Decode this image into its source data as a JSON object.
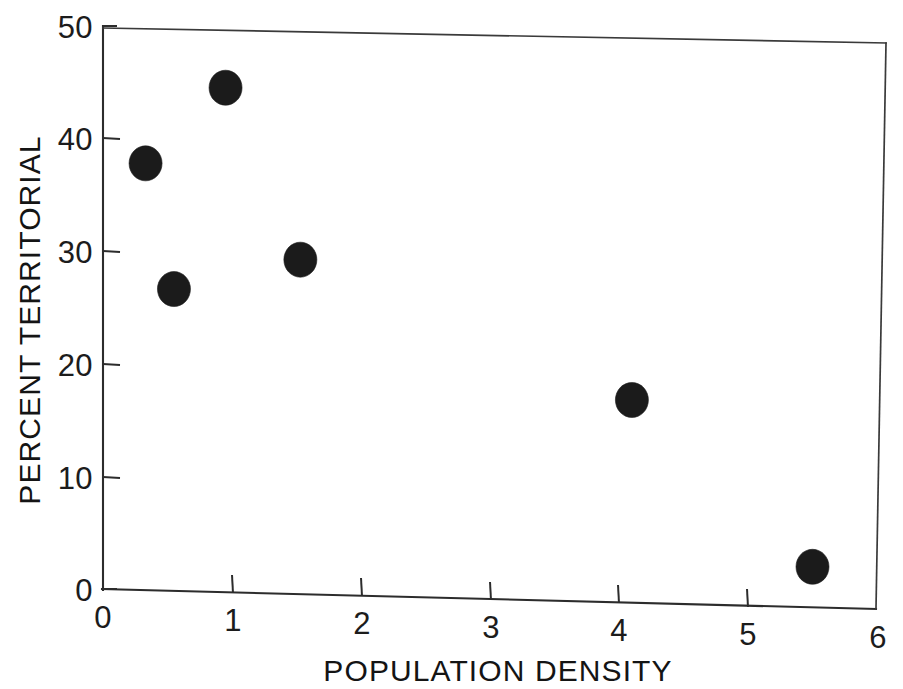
{
  "chart_data": {
    "type": "scatter",
    "title": "",
    "xlabel": "POPULATION DENSITY",
    "ylabel": "PERCENT TERRITORIAL",
    "xlim": [
      0,
      6
    ],
    "ylim": [
      0,
      50
    ],
    "xticks": [
      0,
      1,
      2,
      3,
      4,
      5,
      6
    ],
    "yticks": [
      0,
      10,
      20,
      30,
      40,
      50
    ],
    "xtick_labels": [
      "0",
      "1",
      "2",
      "3",
      "4",
      "5",
      "6"
    ],
    "ytick_labels": [
      "0",
      "10",
      "20",
      "30",
      "40",
      "50"
    ],
    "grid": false,
    "legend": false,
    "legend_position": "none",
    "marker": "filled-circle",
    "marker_color": "#1b1b1b",
    "series": [
      {
        "name": "territoriality vs density",
        "points": [
          {
            "x": 0.33,
            "y": 37.9
          },
          {
            "x": 0.55,
            "y": 26.8
          },
          {
            "x": 0.95,
            "y": 44.8
          },
          {
            "x": 1.53,
            "y": 29.7
          },
          {
            "x": 4.1,
            "y": 18.0
          },
          {
            "x": 5.5,
            "y": 3.6
          }
        ]
      }
    ],
    "x": [
      0.33,
      0.55,
      0.95,
      1.53,
      4.1,
      5.5
    ],
    "y": [
      37.9,
      26.8,
      44.8,
      29.7,
      18.0,
      3.6
    ]
  },
  "axes": {
    "x_axis_label": "POPULATION DENSITY",
    "y_axis_label": "PERCENT TERRITORIAL"
  },
  "colors": {
    "background": "#ffffff",
    "ink": "#1c1c1c",
    "marker": "#1b1b1b",
    "frame": "#3a3a3a"
  }
}
